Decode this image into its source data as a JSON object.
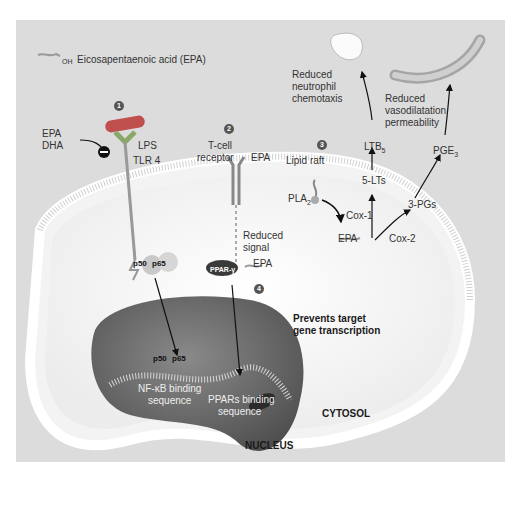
{
  "legend": {
    "icon": "epa-molecule-icon",
    "oh": "OH",
    "o": "O",
    "label": "Eicosapentaenoic acid (EPA)"
  },
  "steps": [
    "1",
    "2",
    "3",
    "4"
  ],
  "inhibitor": {
    "line1": "EPA",
    "line2": "DHA",
    "symbol": "−"
  },
  "receptor1": {
    "lps": "LPS",
    "tlr": "TLR 4"
  },
  "receptor2": {
    "line1": "T-cell",
    "line2": "receptor",
    "epa": "EPA",
    "oh": "OH",
    "o": "O"
  },
  "reduced_signal": {
    "line1": "Reduced",
    "line2": "signal"
  },
  "lipid_raft": "Lipid raft",
  "pla2": {
    "base": "PLA",
    "sub": "2"
  },
  "outcomes": {
    "neutrophil": [
      "Reduced",
      "neutrophil",
      "chemotaxis"
    ],
    "vaso": [
      "Reduced",
      "vasodilatation",
      "permeability"
    ]
  },
  "pathway": {
    "ltb": {
      "base": "LTB",
      "sub": "5"
    },
    "pge": {
      "base": "PGE",
      "sub": "3"
    },
    "lts": "5-LTs",
    "pgs": "3-PGs",
    "cox1": "Cox-1",
    "cox2": "Cox-2",
    "epa": "EPA",
    "o": "O",
    "oh": "OH"
  },
  "complex1": {
    "p50": "p50",
    "p65": "p65"
  },
  "ppar": {
    "label": "PPAR-γ",
    "epa": "EPA",
    "o": "O",
    "oh": "OH"
  },
  "prevents": {
    "line1": "Prevents target",
    "line2": "gene transcription"
  },
  "nfkb": {
    "line1": "NF-κB binding",
    "line2": "sequence"
  },
  "ppars": {
    "line1": "PPARs binding",
    "line2": "sequence"
  },
  "cytosol": "CYTOSOL",
  "nucleus": "NUCLEUS",
  "colors": {
    "panel": "#dcdcdc",
    "lps": "#c0504d",
    "tlr": "#8aa86a",
    "ppar": "#3a3a3a",
    "nucleus": "#6d6d6d",
    "cell": "#f7f7f7"
  }
}
